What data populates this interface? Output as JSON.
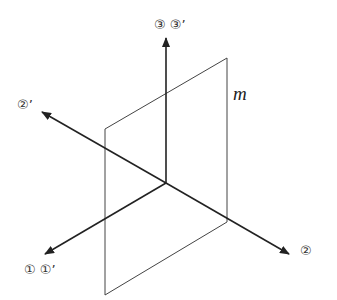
{
  "diagram": {
    "type": "3d-axes-with-plane",
    "axes": [
      {
        "id": "axis-3",
        "label": "③ ③’",
        "direction": "up"
      },
      {
        "id": "axis-2",
        "label": "②",
        "direction": "down-right"
      },
      {
        "id": "axis-2-prime",
        "label": "②’",
        "direction": "up-left"
      },
      {
        "id": "axis-1",
        "label": "① ①’",
        "direction": "down-left"
      }
    ],
    "plane": {
      "label": "m"
    },
    "colors": {
      "line": "#333333",
      "axis": "#222222",
      "background": "#ffffff"
    }
  }
}
